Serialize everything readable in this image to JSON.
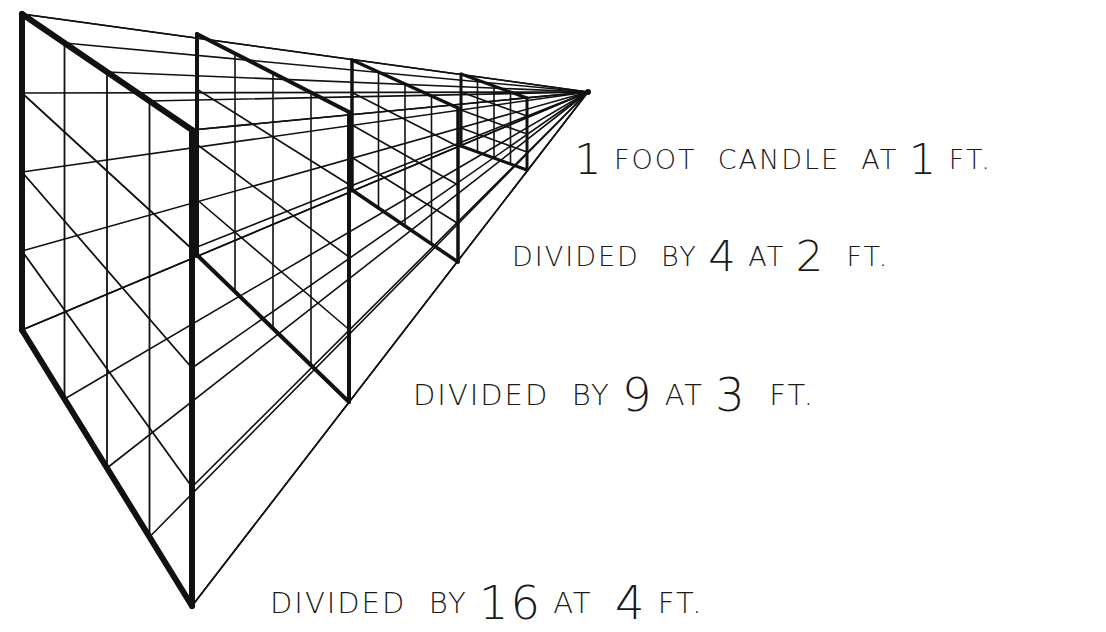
{
  "figure": {
    "colors": {
      "ink": "#111111",
      "background": "#ffffff"
    },
    "vanishing_point": {
      "x": 588,
      "y": 92
    },
    "frames": [
      {
        "distance_ft": 1,
        "divisor": 1,
        "left_x": 22,
        "right_x": 192,
        "top_left_y": 14,
        "top_right_y": 130,
        "bottom_left_y": 330,
        "bottom_right_y": 606,
        "stroke": 6
      },
      {
        "distance_ft": 2,
        "divisor": 4,
        "left_x": 197,
        "right_x": 349,
        "top_left_y": 34,
        "top_right_y": 112,
        "bottom_left_y": 255,
        "bottom_right_y": 402,
        "stroke": 4
      },
      {
        "distance_ft": 3,
        "divisor": 9,
        "left_x": 352,
        "right_x": 458,
        "top_left_y": 60,
        "top_right_y": 108,
        "bottom_left_y": 190,
        "bottom_right_y": 262,
        "stroke": 3.5
      },
      {
        "distance_ft": 4,
        "divisor": 16,
        "left_x": 461,
        "right_x": 527,
        "top_left_y": 74,
        "top_right_y": 98,
        "bottom_left_y": 146,
        "bottom_right_y": 170,
        "stroke": 3
      }
    ],
    "grid_divisions": 4
  },
  "labels": [
    {
      "id": "label-1",
      "parts": [
        {
          "t": "1",
          "big": true
        },
        {
          "t": " FOOT  CANDLE  AT "
        },
        {
          "t": "1",
          "big": true
        },
        {
          "t": " FT."
        }
      ]
    },
    {
      "id": "label-2",
      "parts": [
        {
          "t": "DIVIDED  BY "
        },
        {
          "t": "4",
          "big": true
        },
        {
          "t": " AT "
        },
        {
          "t": "2",
          "big": true
        },
        {
          "t": "  FT."
        }
      ]
    },
    {
      "id": "label-3",
      "parts": [
        {
          "t": "DIVIDED  BY "
        },
        {
          "t": "9",
          "big": true
        },
        {
          "t": " AT "
        },
        {
          "t": "3",
          "big": true
        },
        {
          "t": "  FT."
        }
      ]
    },
    {
      "id": "label-4",
      "parts": [
        {
          "t": "DIVIDED  BY "
        },
        {
          "t": "16",
          "big": true
        },
        {
          "t": " AT  "
        },
        {
          "t": "4",
          "big": true
        },
        {
          "t": " FT."
        }
      ]
    }
  ],
  "text": {
    "line1": "1 FOOT CANDLE AT 1 FT.",
    "line2": "DIVIDED BY 4 AT 2 FT.",
    "line3": "DIVIDED BY 9 AT 3 FT.",
    "line4": "DIVIDED BY 16 AT 4 FT."
  }
}
